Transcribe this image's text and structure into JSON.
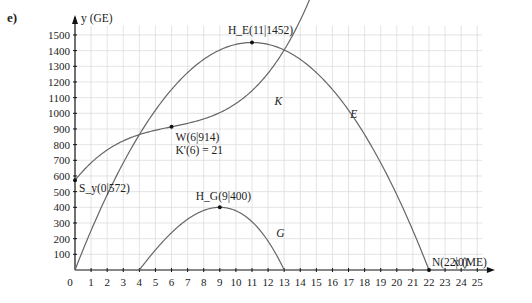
{
  "part_label": "e)",
  "chart_data": {
    "type": "line",
    "title": "",
    "xlabel": "x (ME)",
    "ylabel": "y (GE)",
    "xlim": [
      0,
      25
    ],
    "ylim": [
      0,
      1500
    ],
    "x_ticks": [
      1,
      2,
      3,
      4,
      5,
      6,
      7,
      8,
      9,
      10,
      11,
      12,
      13,
      14,
      15,
      16,
      17,
      18,
      19,
      20,
      21,
      22,
      23,
      24,
      25
    ],
    "y_ticks": [
      100,
      200,
      300,
      400,
      500,
      600,
      700,
      800,
      900,
      1000,
      1100,
      1200,
      1300,
      1400,
      1500
    ],
    "origin_label": "0",
    "grid": true,
    "series": [
      {
        "name": "E",
        "label": "E",
        "domain": [
          0,
          22
        ],
        "formula": "-12x^2 + 264x"
      },
      {
        "name": "K",
        "label": "K",
        "domain": [
          0,
          14.6
        ],
        "formula": "(x-6)^3 + 21(x-6) + 914"
      },
      {
        "name": "G",
        "label": "G",
        "domain": [
          4,
          13
        ],
        "formula": "E(x) - K(x)"
      }
    ],
    "points": [
      {
        "name": "S_y",
        "x": 0,
        "y": 572,
        "label": "S_y(0|572)"
      },
      {
        "name": "W",
        "x": 6,
        "y": 914,
        "label": "W(6|914)",
        "note": "K'(6) = 21"
      },
      {
        "name": "H_E",
        "x": 11,
        "y": 1452,
        "label": "H_E(11|1452)"
      },
      {
        "name": "H_G",
        "x": 9,
        "y": 400,
        "label": "H_G(9|400)"
      },
      {
        "name": "N",
        "x": 22,
        "y": 0,
        "label": "N(22|0)"
      }
    ],
    "colors": {
      "curve": "#666666",
      "grid": "#d9d9d9",
      "axis": "#111111"
    }
  }
}
